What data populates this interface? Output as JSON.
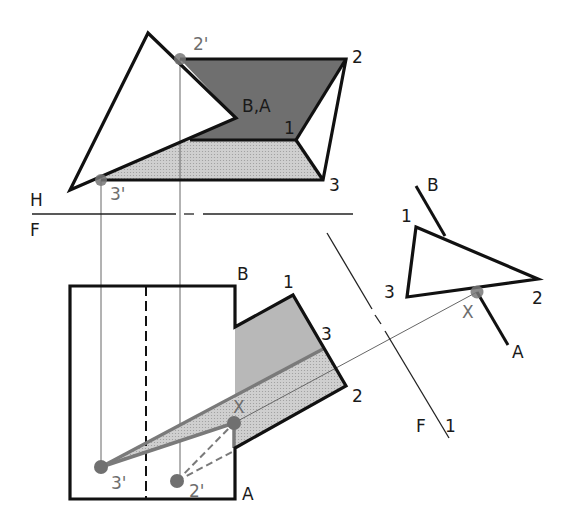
{
  "colors": {
    "ink": "#111111",
    "dark_fill": "#6f6f6f",
    "medium_fill": "#b4b4b4",
    "light_fill": "#d6d6d6",
    "dot": "#707070",
    "projection": "#666666",
    "background": "#ffffff"
  },
  "top_view": {
    "triangle": [
      [
        148,
        33
      ],
      [
        70,
        190
      ],
      [
        236,
        118
      ]
    ],
    "plane_dark": [
      [
        180,
        59
      ],
      [
        346,
        59
      ],
      [
        296,
        140
      ],
      [
        150,
        140
      ],
      [
        236,
        118
      ]
    ],
    "plane_light": [
      [
        101,
        180
      ],
      [
        150,
        140
      ],
      [
        296,
        140
      ],
      [
        323,
        180
      ]
    ],
    "outline": [
      [
        180,
        59
      ],
      [
        346,
        59
      ],
      [
        323,
        180
      ],
      [
        101,
        180
      ]
    ],
    "edge_2_1": [
      [
        346,
        59
      ],
      [
        296,
        140
      ]
    ],
    "edge_1_3": [
      [
        296,
        140
      ],
      [
        323,
        180
      ]
    ],
    "edge_1_left": [
      [
        296,
        140
      ],
      [
        200,
        140
      ]
    ],
    "points": {
      "p2prime": [
        180,
        59
      ],
      "p3prime": [
        101,
        180
      ]
    },
    "labels": {
      "p2prime": "2'",
      "p2": "2",
      "ba": "B,A",
      "p1": "1",
      "p3": "3",
      "p3prime": "3'"
    }
  },
  "fold_hf": {
    "y": 214,
    "label_top": "H",
    "label_bottom": "F"
  },
  "front_view": {
    "body_outline": [
      [
        70,
        286
      ],
      [
        235,
        286
      ],
      [
        235,
        327
      ],
      [
        293,
        295
      ],
      [
        346,
        386
      ],
      [
        235,
        448
      ],
      [
        235,
        499
      ],
      [
        70,
        499
      ]
    ],
    "dashed_x": 146,
    "notch_dark": [
      [
        235,
        327
      ],
      [
        293,
        295
      ],
      [
        323,
        349
      ],
      [
        235,
        398
      ]
    ],
    "notch_light": [
      [
        235,
        398
      ],
      [
        323,
        349
      ],
      [
        346,
        386
      ],
      [
        235,
        448
      ]
    ],
    "points": {
      "p3prime": [
        101,
        467
      ],
      "p2prime": [
        177,
        481
      ],
      "x": [
        234,
        423
      ],
      "p3": [
        323,
        349
      ]
    },
    "labels": {
      "b": "B",
      "p1": "1",
      "p3": "3",
      "p2": "2",
      "a": "A",
      "x": "X",
      "p3prime": "3'",
      "p2prime": "2'"
    }
  },
  "fold_f1": {
    "label_f": "F",
    "label_1": "1"
  },
  "aux_view": {
    "triangle": [
      [
        416,
        227
      ],
      [
        538,
        279
      ],
      [
        407,
        297
      ]
    ],
    "line_b": [
      [
        416,
        186
      ],
      [
        445,
        236
      ]
    ],
    "line_a": [
      [
        477,
        292
      ],
      [
        508,
        345
      ]
    ],
    "x_point": [
      477,
      292
    ],
    "labels": {
      "b": "B",
      "p1": "1",
      "p3": "3",
      "p2": "2",
      "x": "X",
      "a": "A"
    }
  }
}
